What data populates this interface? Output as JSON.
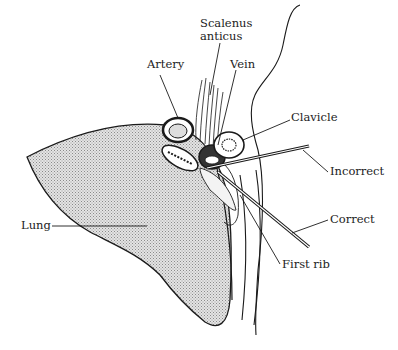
{
  "diagram": {
    "labels": {
      "scalenus": [
        "Scalenus",
        "anticus"
      ],
      "artery": "Artery",
      "vein": "Vein",
      "clavicle": "Clavicle",
      "incorrect": "Incorrect",
      "correct": "Correct",
      "lung": "Lung",
      "first_rib": "First rib"
    },
    "colors": {
      "line": "#1a1a1a",
      "lung_fill": "#c8c8c8",
      "background": "#ffffff"
    }
  }
}
